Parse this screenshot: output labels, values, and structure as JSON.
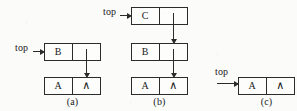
{
  "figure": {
    "background_color": "#fbfbfa",
    "ink_color": "#2b2b2b",
    "null_glyph": "∧",
    "pointer_label": "top"
  },
  "panels": [
    {
      "id": "a",
      "caption": "(a)",
      "top_label": "top",
      "nodes": [
        {
          "data": "B",
          "link": ""
        },
        {
          "data": "A",
          "link": "∧"
        }
      ]
    },
    {
      "id": "b",
      "caption": "(b)",
      "top_label": "top",
      "nodes": [
        {
          "data": "C",
          "link": ""
        },
        {
          "data": "B",
          "link": ""
        },
        {
          "data": "A",
          "link": "∧"
        }
      ]
    },
    {
      "id": "c",
      "caption": "(c)",
      "top_label": "top",
      "nodes": [
        {
          "data": "A",
          "link": "∧"
        }
      ]
    }
  ]
}
